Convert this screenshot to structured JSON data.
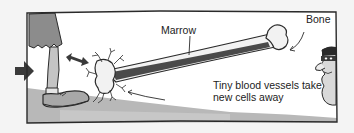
{
  "diagram": {
    "labels": {
      "marrow": "Marrow",
      "bone": "Bone",
      "vessels_line1": "Tiny blood vessels take",
      "vessels_line2": "new cells away"
    },
    "colors": {
      "frame": "#2a2a2a",
      "background": "#ffffff",
      "ground": "#b5b5b5",
      "marrow": "#4a4a4a",
      "bone": "#f2f2f2",
      "arrow": "#3a3a3a",
      "skirt": "#8c8c8c"
    },
    "elements": [
      "leg-with-shoe",
      "push-arrow",
      "double-arrow",
      "bone-with-marrow",
      "blood-vessels",
      "peeking-burglar-character"
    ]
  }
}
